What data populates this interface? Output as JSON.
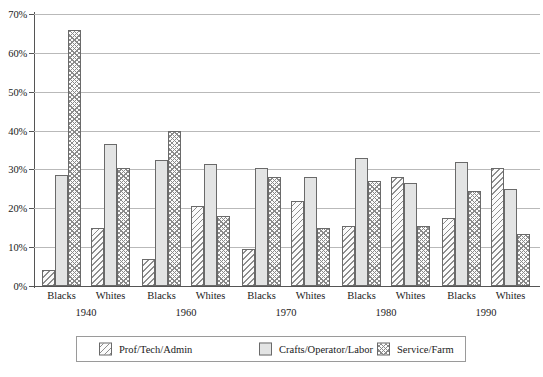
{
  "chart_data": {
    "type": "bar",
    "title": "",
    "subtitle": "",
    "xlabel": "",
    "ylabel": "",
    "ylim": [
      0,
      70
    ],
    "ytick_labels": [
      "0%",
      "10%",
      "20%",
      "30%",
      "40%",
      "50%",
      "60%",
      "70%"
    ],
    "ytick_values": [
      0,
      10,
      20,
      30,
      40,
      50,
      60,
      70
    ],
    "grid": true,
    "legend_position": "bottom",
    "group_labels": [
      "1940",
      "1960",
      "1970",
      "1980",
      "1990"
    ],
    "subgroup_labels": [
      "Blacks",
      "Whites"
    ],
    "categories": [
      "1940 Blacks",
      "1940 Whites",
      "1960 Blacks",
      "1960 Whites",
      "1970 Blacks",
      "1970 Whites",
      "1980 Blacks",
      "1980 Whites",
      "1990 Blacks",
      "1990 Whites"
    ],
    "series": [
      {
        "name": "Prof/Tech/Admin",
        "pattern": "diagonal-hatch",
        "color": "#fbfbfb",
        "values": [
          4.0,
          15.0,
          7.0,
          20.5,
          9.5,
          22.0,
          15.5,
          28.0,
          17.5,
          30.5
        ]
      },
      {
        "name": "Crafts/Operator/Labor",
        "pattern": "solid-light-gray",
        "color": "#e3e4e4",
        "values": [
          28.5,
          36.5,
          32.5,
          31.5,
          30.5,
          28.0,
          33.0,
          26.5,
          32.0,
          25.0
        ]
      },
      {
        "name": "Service/Farm",
        "pattern": "cross-hatch",
        "color": "#fcfcfc",
        "values": [
          66.0,
          30.5,
          40.0,
          18.0,
          28.0,
          15.0,
          27.0,
          15.5,
          24.5,
          13.5
        ]
      }
    ]
  },
  "legend": {
    "items": [
      {
        "label": "Prof/Tech/Admin"
      },
      {
        "label": "Crafts/Operator/Labor"
      },
      {
        "label": "Service/Farm"
      }
    ]
  },
  "colors": {
    "gridline": "#b9b9b9",
    "axis": "#555555",
    "bar_border": "#6a6a6a",
    "background": "#ffffff"
  }
}
